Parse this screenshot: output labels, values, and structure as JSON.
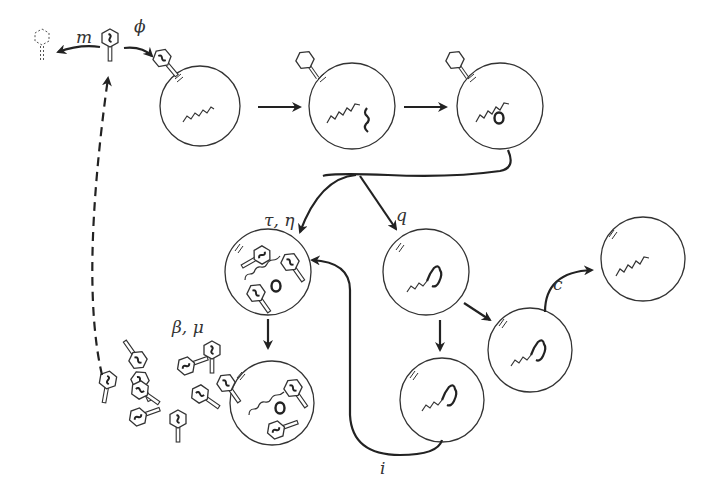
{
  "diagram": {
    "labels": {
      "decay": "m",
      "adsorption": "ϕ",
      "lytic": "τ, η",
      "lysogeny": "q",
      "induction": "i",
      "curing": "c",
      "burst": "β, μ"
    },
    "nodes": [
      {
        "id": "free-phage",
        "desc": "free phage"
      },
      {
        "id": "decayed-phage",
        "desc": "decayed phage"
      },
      {
        "id": "adsorbed-cell",
        "desc": "phage adsorbed to bacterium"
      },
      {
        "id": "injected-cell",
        "desc": "phage DNA injected"
      },
      {
        "id": "circularized-cell",
        "desc": "phage DNA circularized"
      },
      {
        "id": "lytic-cell",
        "desc": "phage replication in cell"
      },
      {
        "id": "burst-cell",
        "desc": "cell lysis releasing phages"
      },
      {
        "id": "lysogen-cell",
        "desc": "prophage integrated"
      },
      {
        "id": "lysogen-daughter-1",
        "desc": "lysogen daughter"
      },
      {
        "id": "lysogen-daughter-2",
        "desc": "lysogen daughter"
      },
      {
        "id": "cured-cell",
        "desc": "cured bacterium"
      }
    ],
    "colors": {
      "ink": "#222222",
      "background": "#ffffff"
    }
  }
}
